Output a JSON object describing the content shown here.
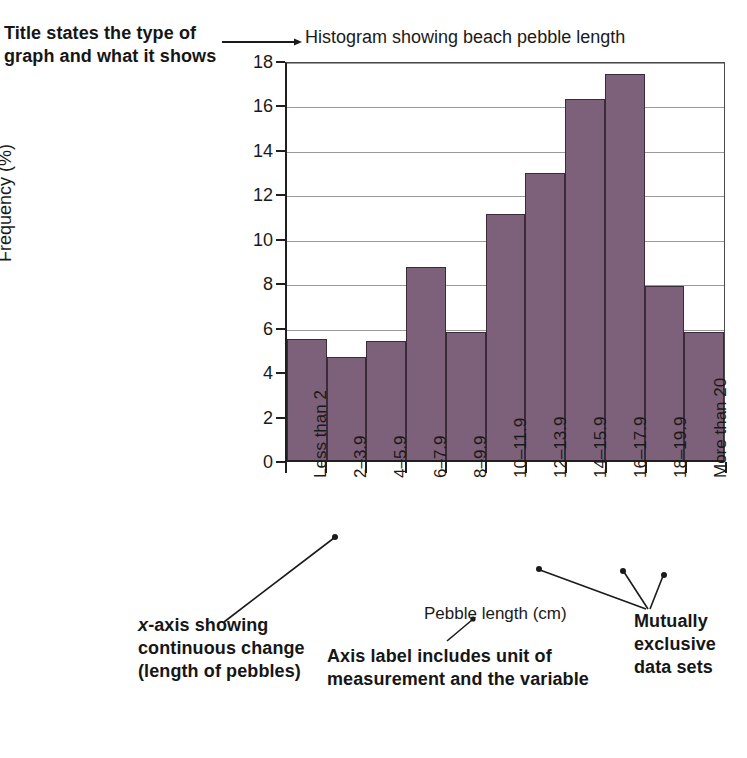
{
  "annotations": {
    "title_note": "Title states the type of graph and what it shows",
    "xaxis_note_prefix": "x",
    "xaxis_note": "-axis showing continuous change (length of pebbles)",
    "axis_label_note": "Axis label includes unit of measurement and the variable",
    "mutual_note": "Mutually exclusive data sets"
  },
  "chart_data": {
    "type": "bar",
    "title": "Histogram showing beach pebble length",
    "xlabel": "Pebble length (cm)",
    "ylabel": "Frequency (%)",
    "ylim": [
      0,
      18
    ],
    "yticks": [
      0,
      2,
      4,
      6,
      8,
      10,
      12,
      14,
      16,
      18
    ],
    "grid": true,
    "legend": "none",
    "bar_color": "#7d6079",
    "bar_edge_color": "#3b2b39",
    "categories": [
      "Less than 2",
      "2–3.9",
      "4–5.9",
      "6–7.9",
      "8–9.9",
      "10–11.9",
      "12–13.9",
      "14–15.9",
      "16–17.9",
      "18–19.9",
      "More than 20"
    ],
    "values": [
      5.45,
      4.65,
      5.35,
      8.7,
      5.75,
      11.05,
      12.9,
      16.25,
      17.35,
      7.85,
      5.75
    ]
  }
}
